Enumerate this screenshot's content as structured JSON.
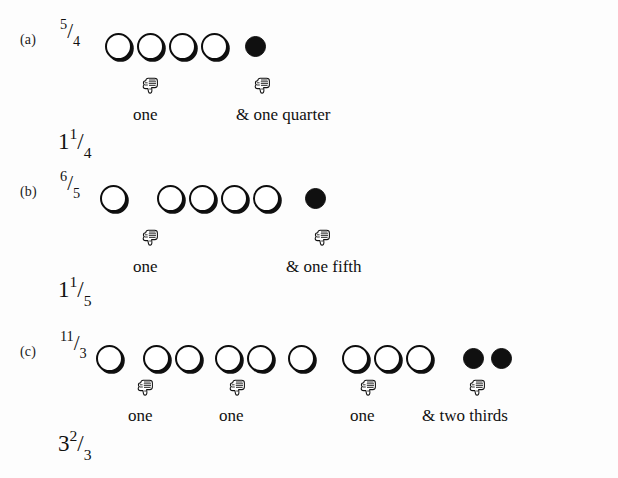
{
  "figure": {
    "type": "math-worksheet-illustration",
    "topic": "Converting improper fractions to mixed numbers using circle counters",
    "background_color": "#fdfdfd",
    "ink_color": "#111111"
  },
  "icons": {
    "hand": "thumbs-down-pointer-icon",
    "hollow_token": "hollow-circle-icon",
    "filled_token": "filled-circle-icon"
  },
  "rows": [
    {
      "tag": "(a)",
      "improper": {
        "whole": "",
        "num": "5",
        "slash": "/",
        "den": "4"
      },
      "mixed": {
        "whole": "1",
        "num": "1",
        "slash": "/",
        "den": "4"
      },
      "groups": [
        {
          "kind": "hollow",
          "count": 4,
          "left": 105,
          "gap": 32
        },
        {
          "kind": "filled",
          "count": 1,
          "left": 245,
          "gap": 30
        }
      ],
      "hands": [
        {
          "left": 140,
          "top": 68
        },
        {
          "left": 252,
          "top": 68
        }
      ],
      "captions": [
        {
          "text": "one",
          "left": 133,
          "top": 98
        },
        {
          "text": "& one quarter",
          "left": 236,
          "top": 98
        }
      ]
    },
    {
      "tag": "(b)",
      "improper": {
        "whole": "",
        "num": "6",
        "slash": "/",
        "den": "5"
      },
      "mixed": {
        "whole": "1",
        "num": "1",
        "slash": "/",
        "den": "5"
      },
      "groups": [
        {
          "kind": "hollow",
          "count": 1,
          "left": 100,
          "gap": 32
        },
        {
          "kind": "hollow",
          "count": 4,
          "left": 157,
          "gap": 32
        },
        {
          "kind": "filled",
          "count": 1,
          "left": 305,
          "gap": 30
        }
      ],
      "hands": [
        {
          "left": 140,
          "top": 68
        },
        {
          "left": 312,
          "top": 68
        }
      ],
      "captions": [
        {
          "text": "one",
          "left": 133,
          "top": 98
        },
        {
          "text": "& one fifth",
          "left": 286,
          "top": 98
        }
      ]
    },
    {
      "tag": "(c)",
      "improper": {
        "whole": "",
        "num": "11",
        "slash": "/",
        "den": "3"
      },
      "mixed": {
        "whole": "3",
        "num": "2",
        "slash": "/",
        "den": "3"
      },
      "groups": [
        {
          "kind": "hollow",
          "count": 1,
          "left": 96,
          "gap": 32
        },
        {
          "kind": "hollow",
          "count": 2,
          "left": 143,
          "gap": 32
        },
        {
          "kind": "hollow",
          "count": 2,
          "left": 215,
          "gap": 32
        },
        {
          "kind": "hollow",
          "count": 1,
          "left": 288,
          "gap": 32
        },
        {
          "kind": "hollow",
          "count": 3,
          "left": 342,
          "gap": 32
        },
        {
          "kind": "filled",
          "count": 2,
          "left": 463,
          "gap": 28
        }
      ],
      "hands": [
        {
          "left": 135,
          "top": 58
        },
        {
          "left": 227,
          "top": 58
        },
        {
          "left": 358,
          "top": 58
        },
        {
          "left": 467,
          "top": 58
        }
      ],
      "captions": [
        {
          "text": "one",
          "left": 128,
          "top": 87
        },
        {
          "text": "one",
          "left": 219,
          "top": 87
        },
        {
          "text": "one",
          "left": 350,
          "top": 87
        },
        {
          "text": "& two thirds",
          "left": 422,
          "top": 87
        }
      ]
    }
  ]
}
